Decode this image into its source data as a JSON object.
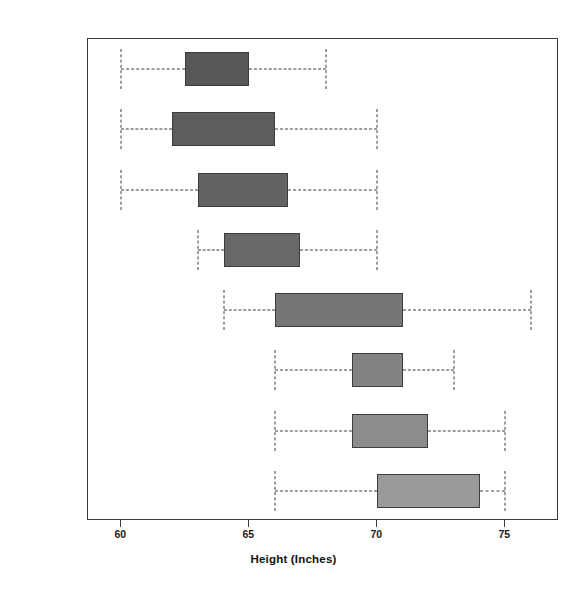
{
  "chart_data": {
    "type": "box",
    "title": "",
    "xlabel": "Height (Inches)",
    "ylabel": "",
    "xlim": [
      58.7,
      77.1
    ],
    "xticks": [
      60,
      65,
      70,
      75
    ],
    "xticklabels": [
      "60",
      "65",
      "70",
      "75"
    ],
    "grid": false,
    "legend": "none",
    "orientation": "horizontal",
    "categories": [
      "Soprano 1",
      "Soprano 2",
      "Alto 1",
      "Alto 2",
      "Tenor 1",
      "Tenor 2",
      "Bass 1",
      "Bass 2"
    ],
    "boxes": [
      {
        "name": "Soprano 1",
        "whisker_low": 60.0,
        "q1": 62.5,
        "q3": 65.0,
        "whisker_high": 68.0,
        "fill": "#585858"
      },
      {
        "name": "Soprano 2",
        "whisker_low": 60.0,
        "q1": 62.0,
        "q3": 66.0,
        "whisker_high": 70.0,
        "fill": "#5d5d5d"
      },
      {
        "name": "Alto 1",
        "whisker_low": 60.0,
        "q1": 63.0,
        "q3": 66.5,
        "whisker_high": 70.0,
        "fill": "#636363"
      },
      {
        "name": "Alto 2",
        "whisker_low": 63.0,
        "q1": 64.0,
        "q3": 67.0,
        "whisker_high": 70.0,
        "fill": "#686868"
      },
      {
        "name": "Tenor 1",
        "whisker_low": 64.0,
        "q1": 66.0,
        "q3": 71.0,
        "whisker_high": 76.0,
        "fill": "#767676"
      },
      {
        "name": "Tenor 2",
        "whisker_low": 66.0,
        "q1": 69.0,
        "q3": 71.0,
        "whisker_high": 73.0,
        "fill": "#828282"
      },
      {
        "name": "Bass 1",
        "whisker_low": 66.0,
        "q1": 69.0,
        "q3": 72.0,
        "whisker_high": 75.0,
        "fill": "#8c8c8c"
      },
      {
        "name": "Bass 2",
        "whisker_low": 66.0,
        "q1": 70.0,
        "q3": 74.0,
        "whisker_high": 75.0,
        "fill": "#9a9a9a"
      }
    ]
  },
  "axis": {
    "x_title": "Height (Inches)",
    "tick_labels": [
      "60",
      "65",
      "70",
      "75"
    ]
  },
  "colors": {
    "frame": "#3a3a3a",
    "text": "#1a1a1a",
    "background": "#ffffff"
  }
}
